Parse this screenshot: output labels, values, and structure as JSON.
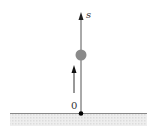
{
  "diagram": {
    "axis": {
      "label": "s",
      "direction": "up"
    },
    "origin": {
      "label": "0"
    },
    "object": {
      "shape": "ball",
      "color": "#8a8a8a"
    },
    "velocity_arrow": {
      "direction": "up"
    },
    "ground": {
      "line_color": "#888888",
      "fill_color": "#e6e6e6"
    }
  }
}
